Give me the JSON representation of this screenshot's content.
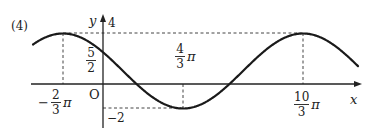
{
  "problem_label": "(4)",
  "chart_data": {
    "type": "line",
    "title": "",
    "function": "y = 3cos((x + 2π/3)/2) + 1",
    "xlabel": "x",
    "ylabel": "y",
    "origin_label": "O",
    "amplitude": 3,
    "midline": 1,
    "period": "4π",
    "max_value": 4,
    "min_value": -2,
    "y_intercept": "5/2",
    "x_ticks": [
      {
        "sign": "−",
        "num": "2",
        "den": "3",
        "suffix": "π",
        "value": -2.0944
      },
      {
        "sign": "",
        "num": "4",
        "den": "3",
        "suffix": "π",
        "value": 4.1888
      },
      {
        "sign": "",
        "num": "10",
        "den": "3",
        "suffix": "π",
        "value": 10.472
      }
    ],
    "y_ticks": [
      {
        "label": "4",
        "value": 4
      },
      {
        "num": "5",
        "den": "2",
        "value": 2.5
      },
      {
        "label": "−2",
        "value": -2
      }
    ],
    "key_points": [
      {
        "x": "-2π/3",
        "y": 4,
        "type": "max"
      },
      {
        "x": "0",
        "y": 2.5,
        "type": "y-intercept"
      },
      {
        "x": "4π/3",
        "y": -2,
        "type": "min"
      },
      {
        "x": "10π/3",
        "y": 4,
        "type": "max"
      }
    ],
    "xlim": [
      -2.7,
      14.0
    ],
    "ylim": [
      -3.5,
      5.3
    ],
    "grid": false,
    "guide_lines": "dashed",
    "colors": {
      "curve": "#1a1a1a",
      "axes": "#222222",
      "guides": "#444444"
    }
  }
}
